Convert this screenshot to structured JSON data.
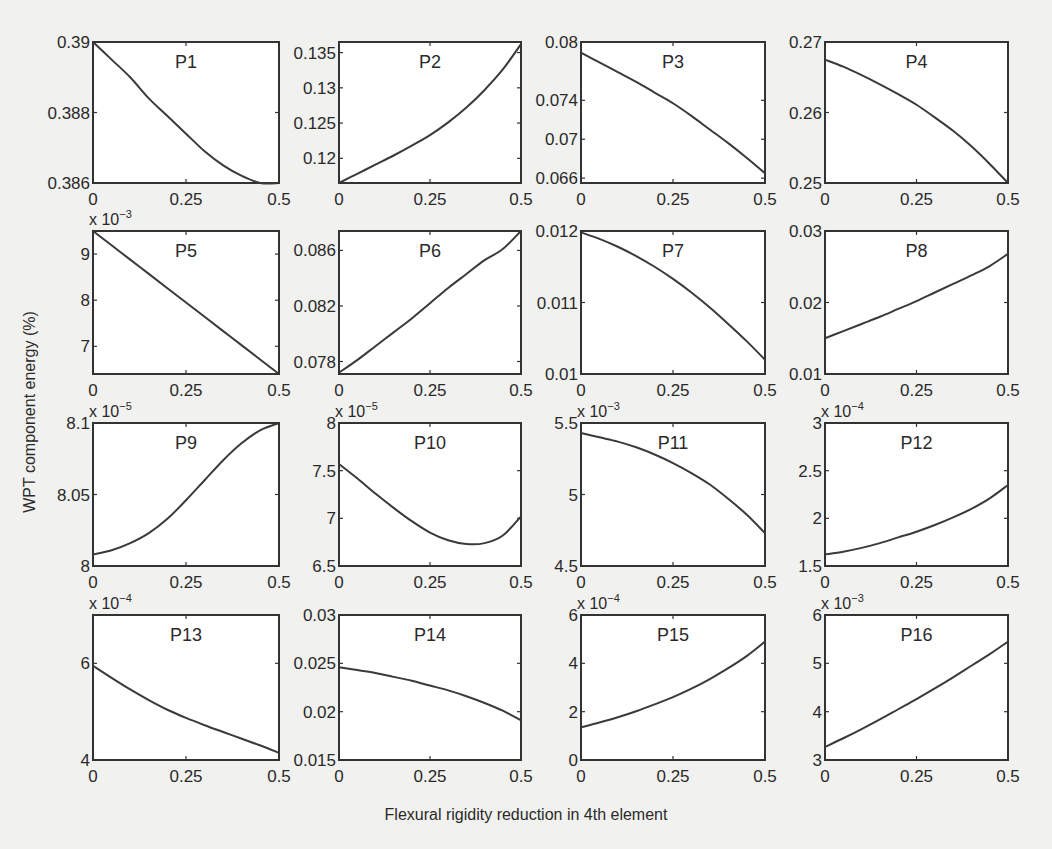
{
  "figure": {
    "xlabel": "Flexural rigidity reduction in 4th element",
    "ylabel": "WPT component energy (%)"
  },
  "chart_data": [
    {
      "type": "line",
      "title": "P1",
      "xlabel": "",
      "ylabel": "",
      "x": [
        0,
        0.05,
        0.1,
        0.15,
        0.2,
        0.25,
        0.3,
        0.35,
        0.4,
        0.45,
        0.5
      ],
      "values": [
        0.39,
        0.3895,
        0.389,
        0.3884,
        0.3879,
        0.3874,
        0.3869,
        0.3865,
        0.3862,
        0.386,
        0.386
      ],
      "xlim": [
        0,
        0.5
      ],
      "ylim": [
        0.386,
        0.39
      ],
      "xticks": [
        "0",
        "0.25",
        "0.5"
      ],
      "yticks": [
        "0.386",
        "0.388",
        "0.39"
      ],
      "exponent": ""
    },
    {
      "type": "line",
      "title": "P2",
      "xlabel": "",
      "ylabel": "",
      "x": [
        0,
        0.05,
        0.1,
        0.15,
        0.2,
        0.25,
        0.3,
        0.35,
        0.4,
        0.45,
        0.5
      ],
      "values": [
        0.1165,
        0.1178,
        0.1191,
        0.1204,
        0.1218,
        0.1233,
        0.1251,
        0.1272,
        0.1297,
        0.1326,
        0.1362
      ],
      "xlim": [
        0,
        0.5
      ],
      "ylim": [
        0.1165,
        0.1365
      ],
      "xticks": [
        "0",
        "0.25",
        "0.5"
      ],
      "yticks": [
        "0.12",
        "0.125",
        "0.13",
        "0.135"
      ],
      "exponent": ""
    },
    {
      "type": "line",
      "title": "P3",
      "xlabel": "",
      "ylabel": "",
      "x": [
        0,
        0.05,
        0.1,
        0.15,
        0.2,
        0.25,
        0.3,
        0.35,
        0.4,
        0.45,
        0.5
      ],
      "values": [
        0.0789,
        0.0779,
        0.0769,
        0.0759,
        0.0748,
        0.0737,
        0.0724,
        0.071,
        0.0696,
        0.0681,
        0.0665
      ],
      "xlim": [
        0,
        0.5
      ],
      "ylim": [
        0.0655,
        0.08
      ],
      "xticks": [
        "0",
        "0.25",
        "0.5"
      ],
      "yticks": [
        "0.066",
        "0.07",
        "0.074",
        "0.08"
      ],
      "exponent": ""
    },
    {
      "type": "line",
      "title": "P4",
      "xlabel": "",
      "ylabel": "",
      "x": [
        0,
        0.05,
        0.1,
        0.15,
        0.2,
        0.25,
        0.3,
        0.35,
        0.4,
        0.45,
        0.5
      ],
      "values": [
        0.2675,
        0.2665,
        0.2653,
        0.264,
        0.2626,
        0.2611,
        0.2593,
        0.2574,
        0.2552,
        0.2527,
        0.25
      ],
      "xlim": [
        0,
        0.5
      ],
      "ylim": [
        0.25,
        0.27
      ],
      "xticks": [
        "0",
        "0.25",
        "0.5"
      ],
      "yticks": [
        "0.25",
        "0.26",
        "0.27"
      ],
      "exponent": ""
    },
    {
      "type": "line",
      "title": "P5",
      "xlabel": "",
      "ylabel": "",
      "x": [
        0,
        0.05,
        0.1,
        0.15,
        0.2,
        0.25,
        0.3,
        0.35,
        0.4,
        0.45,
        0.5
      ],
      "values": [
        9.5,
        9.19,
        8.88,
        8.57,
        8.26,
        7.95,
        7.64,
        7.33,
        7.02,
        6.71,
        6.4
      ],
      "xlim": [
        0,
        0.5
      ],
      "ylim": [
        6.4,
        9.5
      ],
      "xticks": [
        "0",
        "0.25",
        "0.5"
      ],
      "yticks": [
        "7",
        "8",
        "9"
      ],
      "exponent": "x 10^-3"
    },
    {
      "type": "line",
      "title": "P6",
      "xlabel": "",
      "ylabel": "",
      "x": [
        0,
        0.05,
        0.1,
        0.15,
        0.2,
        0.25,
        0.3,
        0.35,
        0.4,
        0.45,
        0.5
      ],
      "values": [
        0.0772,
        0.0781,
        0.0791,
        0.0801,
        0.0811,
        0.0822,
        0.0833,
        0.0843,
        0.0853,
        0.0861,
        0.0874
      ],
      "xlim": [
        0,
        0.5
      ],
      "ylim": [
        0.0771,
        0.0874
      ],
      "xticks": [
        "0",
        "0.25",
        "0.5"
      ],
      "yticks": [
        "0.078",
        "0.082",
        "0.086"
      ],
      "exponent": ""
    },
    {
      "type": "line",
      "title": "P7",
      "xlabel": "",
      "ylabel": "",
      "x": [
        0,
        0.05,
        0.1,
        0.15,
        0.2,
        0.25,
        0.3,
        0.35,
        0.4,
        0.45,
        0.5
      ],
      "values": [
        0.01198,
        0.01189,
        0.01178,
        0.01165,
        0.0115,
        0.01133,
        0.01114,
        0.01093,
        0.0107,
        0.01046,
        0.0102
      ],
      "xlim": [
        0,
        0.5
      ],
      "ylim": [
        0.01,
        0.012
      ],
      "xticks": [
        "0",
        "0.25",
        "0.5"
      ],
      "yticks": [
        "0.01",
        "0.011",
        "0.012"
      ],
      "exponent": ""
    },
    {
      "type": "line",
      "title": "P8",
      "xlabel": "",
      "ylabel": "",
      "x": [
        0,
        0.05,
        0.1,
        0.15,
        0.2,
        0.25,
        0.3,
        0.35,
        0.4,
        0.45,
        0.5
      ],
      "values": [
        0.015,
        0.016,
        0.017,
        0.018,
        0.0191,
        0.0202,
        0.0214,
        0.0226,
        0.0238,
        0.0251,
        0.0268
      ],
      "xlim": [
        0,
        0.5
      ],
      "ylim": [
        0.01,
        0.03
      ],
      "xticks": [
        "0",
        "0.25",
        "0.5"
      ],
      "yticks": [
        "0.01",
        "0.02",
        "0.03"
      ],
      "exponent": ""
    },
    {
      "type": "line",
      "title": "P9",
      "xlabel": "",
      "ylabel": "",
      "x": [
        0,
        0.05,
        0.1,
        0.15,
        0.2,
        0.25,
        0.3,
        0.35,
        0.4,
        0.45,
        0.5
      ],
      "values": [
        8.008,
        8.011,
        8.016,
        8.023,
        8.033,
        8.046,
        8.06,
        8.074,
        8.086,
        8.095,
        8.1
      ],
      "xlim": [
        0,
        0.5
      ],
      "ylim": [
        8.0,
        8.1
      ],
      "xticks": [
        "0",
        "0.25",
        "0.5"
      ],
      "yticks": [
        "8",
        "8.05",
        "8.1"
      ],
      "exponent": "x 10^-5"
    },
    {
      "type": "line",
      "title": "P10",
      "xlabel": "",
      "ylabel": "",
      "x": [
        0,
        0.05,
        0.1,
        0.15,
        0.2,
        0.25,
        0.3,
        0.35,
        0.4,
        0.45,
        0.5
      ],
      "values": [
        7.57,
        7.42,
        7.26,
        7.11,
        6.97,
        6.85,
        6.77,
        6.73,
        6.74,
        6.82,
        7.02
      ],
      "xlim": [
        0,
        0.5
      ],
      "ylim": [
        6.5,
        8.0
      ],
      "xticks": [
        "0",
        "0.25",
        "0.5"
      ],
      "yticks": [
        "6.5",
        "7",
        "7.5",
        "8"
      ],
      "exponent": "x 10^-5"
    },
    {
      "type": "line",
      "title": "P11",
      "xlabel": "",
      "ylabel": "",
      "x": [
        0,
        0.05,
        0.1,
        0.15,
        0.2,
        0.25,
        0.3,
        0.35,
        0.4,
        0.45,
        0.5
      ],
      "values": [
        5.43,
        5.4,
        5.37,
        5.33,
        5.28,
        5.22,
        5.15,
        5.07,
        4.97,
        4.86,
        4.73
      ],
      "xlim": [
        0,
        0.5
      ],
      "ylim": [
        4.5,
        5.5
      ],
      "xticks": [
        "0",
        "0.25",
        "0.5"
      ],
      "yticks": [
        "4.5",
        "5",
        "5.5"
      ],
      "exponent": "x 10^-3"
    },
    {
      "type": "line",
      "title": "P12",
      "xlabel": "",
      "ylabel": "",
      "x": [
        0,
        0.05,
        0.1,
        0.15,
        0.2,
        0.25,
        0.3,
        0.35,
        0.4,
        0.45,
        0.5
      ],
      "values": [
        1.62,
        1.65,
        1.69,
        1.74,
        1.8,
        1.86,
        1.93,
        2.01,
        2.1,
        2.21,
        2.35
      ],
      "xlim": [
        0,
        0.5
      ],
      "ylim": [
        1.5,
        3.0
      ],
      "xticks": [
        "0",
        "0.25",
        "0.5"
      ],
      "yticks": [
        "1.5",
        "2",
        "2.5",
        "3"
      ],
      "exponent": "x 10^-4"
    },
    {
      "type": "line",
      "title": "P13",
      "xlabel": "",
      "ylabel": "",
      "x": [
        0,
        0.05,
        0.1,
        0.15,
        0.2,
        0.25,
        0.3,
        0.35,
        0.4,
        0.45,
        0.5
      ],
      "values": [
        5.95,
        5.7,
        5.46,
        5.24,
        5.04,
        4.87,
        4.72,
        4.58,
        4.44,
        4.3,
        4.15
      ],
      "xlim": [
        0,
        0.5
      ],
      "ylim": [
        4.0,
        7.0
      ],
      "xticks": [
        "0",
        "0.25",
        "0.5"
      ],
      "yticks": [
        "4",
        "6"
      ],
      "exponent": "x 10^-4"
    },
    {
      "type": "line",
      "title": "P14",
      "xlabel": "",
      "ylabel": "",
      "x": [
        0,
        0.05,
        0.1,
        0.15,
        0.2,
        0.25,
        0.3,
        0.35,
        0.4,
        0.45,
        0.5
      ],
      "values": [
        0.0246,
        0.0243,
        0.024,
        0.0236,
        0.0232,
        0.0227,
        0.0222,
        0.0216,
        0.0209,
        0.0201,
        0.0191
      ],
      "xlim": [
        0,
        0.5
      ],
      "ylim": [
        0.015,
        0.03
      ],
      "xticks": [
        "0",
        "0.25",
        "0.5"
      ],
      "yticks": [
        "0.015",
        "0.02",
        "0.025",
        "0.03"
      ],
      "exponent": ""
    },
    {
      "type": "line",
      "title": "P15",
      "xlabel": "",
      "ylabel": "",
      "x": [
        0,
        0.05,
        0.1,
        0.15,
        0.2,
        0.25,
        0.3,
        0.35,
        0.4,
        0.45,
        0.5
      ],
      "values": [
        1.35,
        1.55,
        1.77,
        2.02,
        2.3,
        2.6,
        2.95,
        3.35,
        3.8,
        4.3,
        4.9
      ],
      "xlim": [
        0,
        0.5
      ],
      "ylim": [
        0,
        6
      ],
      "xticks": [
        "0",
        "0.25",
        "0.5"
      ],
      "yticks": [
        "0",
        "2",
        "4",
        "6"
      ],
      "exponent": "x 10^-4"
    },
    {
      "type": "line",
      "title": "P16",
      "xlabel": "",
      "ylabel": "",
      "x": [
        0,
        0.05,
        0.1,
        0.15,
        0.2,
        0.25,
        0.3,
        0.35,
        0.4,
        0.45,
        0.5
      ],
      "values": [
        3.27,
        3.45,
        3.64,
        3.84,
        4.05,
        4.26,
        4.48,
        4.71,
        4.95,
        5.19,
        5.45
      ],
      "xlim": [
        0,
        0.5
      ],
      "ylim": [
        3,
        6
      ],
      "xticks": [
        "0",
        "0.25",
        "0.5"
      ],
      "yticks": [
        "3",
        "4",
        "5",
        "6"
      ],
      "exponent": "x 10^-3"
    }
  ]
}
